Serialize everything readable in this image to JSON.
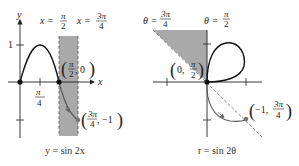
{
  "left_plot": {
    "caption": "y = sin 2x",
    "axis_x_label": "x",
    "axis_y_label": "y",
    "y_tick_label": "1",
    "x_tick_label_num": "π",
    "x_tick_label_den": "4",
    "vline1_label_lhs": "x =",
    "vline1_label_num": "π",
    "vline1_label_den": "2",
    "vline2_label_lhs": "x =",
    "vline2_label_num": "3π",
    "vline2_label_den": "4",
    "point1_label_num": "π",
    "point1_label_den": "2",
    "point1_label_rest": ", 0",
    "point2_label_num": "3π",
    "point2_label_den": "4",
    "point2_label_rest": ", −1",
    "shade_color": "#a9a9a9",
    "curve_color": "#111111",
    "curve_gray_color": "#666666"
  },
  "right_plot": {
    "caption": "r = sin 2θ",
    "line1_label_lhs": "θ =",
    "line1_label_num": "3π",
    "line1_label_den": "4",
    "line2_label_lhs": "θ =",
    "line2_label_num": "π",
    "line2_label_den": "2",
    "point1_label_pre": "0, ",
    "point1_label_num": "π",
    "point1_label_den": "2",
    "point2_label_pre": "−1, ",
    "point2_label_num": "3π",
    "point2_label_den": "4",
    "shade_color": "#a9a9a9",
    "curve_color": "#111111",
    "curve_gray_color": "#666666"
  }
}
